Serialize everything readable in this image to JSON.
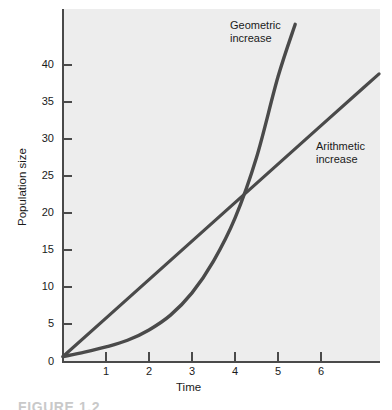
{
  "figure": {
    "caption_partial": "FIGURE 1.2"
  },
  "chart_data": {
    "type": "line",
    "title": "",
    "xlabel": "Time",
    "ylabel": "Population size",
    "xlim": [
      0,
      7.35
    ],
    "ylim": [
      0,
      45.5
    ],
    "grid": false,
    "legend_position": "inline-annotations",
    "xticks": [
      1,
      2,
      3,
      4,
      5,
      6
    ],
    "xtick_labels": [
      "1",
      "2",
      "3",
      "4",
      "5",
      "6"
    ],
    "yticks": [
      0,
      5,
      10,
      15,
      20,
      25,
      30,
      35,
      40
    ],
    "ytick_labels": [
      "0",
      "5",
      "10",
      "15",
      "20",
      "25",
      "30",
      "35",
      "40"
    ],
    "plot_background_color": "#ededed",
    "line_color": "#4a4a4a",
    "annotations": [
      {
        "text_line1": "Geometric",
        "text_line2": "increase",
        "x": 3.9,
        "y": 43.5
      },
      {
        "text_line1": "Arithmetic",
        "text_line2": "increase",
        "x": 5.9,
        "y": 28.5
      }
    ],
    "series": [
      {
        "name": "Arithmetic increase",
        "x": [
          0,
          1,
          2,
          3,
          4,
          5,
          6,
          7,
          7.35
        ],
        "values": [
          0.6,
          5.8,
          11.0,
          16.2,
          21.4,
          26.6,
          31.8,
          37.0,
          38.8
        ]
      },
      {
        "name": "Geometric increase",
        "x": [
          0,
          0.5,
          1,
          1.5,
          2,
          2.5,
          3,
          3.5,
          4,
          4.5,
          5,
          5.4
        ],
        "values": [
          0.6,
          1.2,
          1.9,
          2.8,
          4.2,
          6.2,
          9.2,
          13.5,
          19.3,
          27.5,
          38.4,
          45.5
        ]
      }
    ],
    "crossing_point": {
      "x": 4.65,
      "y": 24.2
    }
  }
}
